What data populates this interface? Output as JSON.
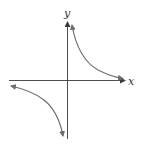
{
  "figure": {
    "x_axis_label": "x",
    "y_axis_label": "y"
  },
  "colors": {
    "axes": "#3a3a3a",
    "curve": "#6e6e6e",
    "background": "#ffffff"
  },
  "curves": [
    {
      "name": "branch-quadrant-1",
      "direction": "arrows at both ends, approaching y-axis upward and x-axis rightward"
    },
    {
      "name": "branch-quadrant-3",
      "direction": "arrows at both ends, approaching x-axis leftward and y-axis downward"
    }
  ]
}
